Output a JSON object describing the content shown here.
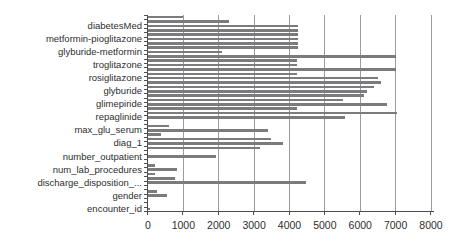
{
  "chart_data": {
    "type": "bar",
    "orientation": "horizontal",
    "title": "",
    "xlabel": "",
    "ylabel": "",
    "xlim": [
      0,
      8000
    ],
    "x_tick_step": 1000,
    "x_tick_labels": [
      "0",
      "1000",
      "2000",
      "3000",
      "4000",
      "5000",
      "6000",
      "7000",
      "8000"
    ],
    "grid": true,
    "legend": "none",
    "bar_color": "#7b7b7d",
    "gridline_color": "#9b9b9b",
    "axis_color": "#4f4f4f",
    "text_color": "#2e2e2e",
    "bars": [
      {
        "label": "",
        "value": 1000
      },
      {
        "label": "",
        "value": 2300
      },
      {
        "label": "diabetesMed",
        "value": 4250
      },
      {
        "label": "",
        "value": 4250
      },
      {
        "label": "",
        "value": 4250
      },
      {
        "label": "metformin-pioglitazone",
        "value": 4250
      },
      {
        "label": "",
        "value": 4250
      },
      {
        "label": "",
        "value": 4250
      },
      {
        "label": "glyburide-metformin",
        "value": 2100
      },
      {
        "label": "",
        "value": 7000
      },
      {
        "label": "",
        "value": 4200
      },
      {
        "label": "troglitazone",
        "value": 4200
      },
      {
        "label": "",
        "value": 7000
      },
      {
        "label": "",
        "value": 4200
      },
      {
        "label": "rosiglitazone",
        "value": 6500
      },
      {
        "label": "",
        "value": 6600
      },
      {
        "label": "",
        "value": 6400
      },
      {
        "label": "glyburide",
        "value": 6200
      },
      {
        "label": "",
        "value": 6100
      },
      {
        "label": "",
        "value": 5500
      },
      {
        "label": "glimepiride",
        "value": 6750
      },
      {
        "label": "",
        "value": 4200
      },
      {
        "label": "",
        "value": 7050
      },
      {
        "label": "repaglinide",
        "value": 5570
      },
      {
        "label": "",
        "value": 0
      },
      {
        "label": "",
        "value": 600
      },
      {
        "label": "max_glu_serum",
        "value": 3400
      },
      {
        "label": "",
        "value": 380
      },
      {
        "label": "",
        "value": 3470
      },
      {
        "label": "diag_1",
        "value": 3820
      },
      {
        "label": "",
        "value": 3180
      },
      {
        "label": "",
        "value": 0
      },
      {
        "label": "number_outpatient",
        "value": 1930
      },
      {
        "label": "",
        "value": 0
      },
      {
        "label": "",
        "value": 210
      },
      {
        "label": "num_lab_procedures",
        "value": 825
      },
      {
        "label": "",
        "value": 200
      },
      {
        "label": "",
        "value": 770
      },
      {
        "label": "discharge_disposition_...",
        "value": 4480
      },
      {
        "label": "",
        "value": 0
      },
      {
        "label": "",
        "value": 265
      },
      {
        "label": "gender",
        "value": 550
      },
      {
        "label": "",
        "value": 0
      },
      {
        "label": "",
        "value": 0
      },
      {
        "label": "encounter_id",
        "value": 50
      }
    ],
    "layout": {
      "plot_left": 148,
      "plot_top": 15,
      "plot_width": 283,
      "plot_height": 196,
      "bar_thickness": 2.6
    }
  }
}
